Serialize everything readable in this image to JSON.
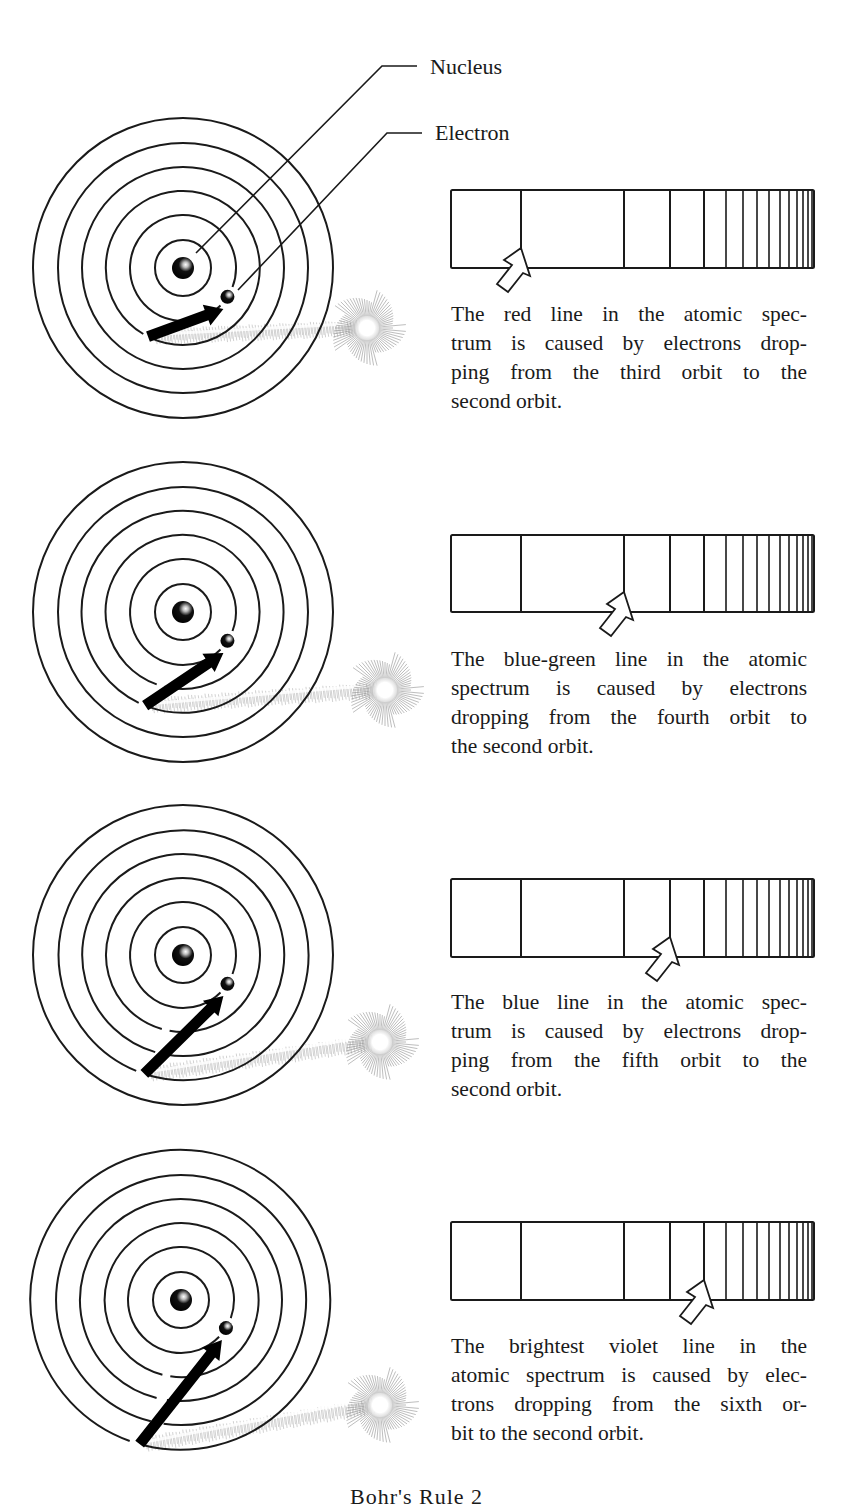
{
  "labels": {
    "nucleus": "Nucleus",
    "electron": "Electron"
  },
  "footer": {
    "caption_partial": "Bohr's Rule 2"
  },
  "colors": {
    "ink": "#1a1a1a",
    "paper": "#ffffff",
    "glow": "#9a9a9a"
  },
  "panels": [
    {
      "from_orbit": 3,
      "to_orbit": 2,
      "line": "red",
      "arrow_line_index": 1,
      "caption_lines": [
        "The red line in the atomic spec-",
        "trum is caused by electrons drop-",
        "ping from the third orbit to the",
        "second orbit."
      ]
    },
    {
      "from_orbit": 4,
      "to_orbit": 2,
      "line": "blue-green",
      "arrow_line_index": 2,
      "caption_lines": [
        "The blue-green line in the atomic",
        "spectrum is caused by electrons",
        "dropping from the fourth orbit to",
        "the second orbit."
      ]
    },
    {
      "from_orbit": 5,
      "to_orbit": 2,
      "line": "blue",
      "arrow_line_index": 3,
      "caption_lines": [
        "The blue line in the atomic spec-",
        "trum is caused by electrons drop-",
        "ping from the fifth orbit to the",
        "second orbit."
      ]
    },
    {
      "from_orbit": 6,
      "to_orbit": 2,
      "line": "brightest violet",
      "arrow_line_index": 4,
      "caption_lines": [
        "The brightest violet line in the",
        "atomic spectrum is caused by elec-",
        "trons dropping from the sixth or-",
        "bit to the second orbit."
      ]
    }
  ],
  "spectrum": {
    "left": 451,
    "right": 814,
    "line_positions": [
      521,
      624,
      670,
      704,
      726,
      743,
      757,
      769,
      780,
      789,
      797,
      803,
      808,
      812
    ]
  },
  "atom": {
    "orbit_radii": [
      28,
      53,
      77,
      101,
      125,
      150
    ],
    "nucleus_radius": 11,
    "electron_radius": 7
  }
}
